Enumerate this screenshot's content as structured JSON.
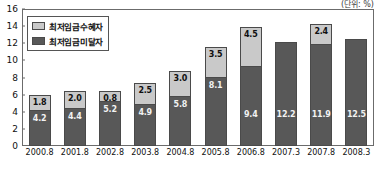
{
  "unit_note": "(단위: %)",
  "legend": {
    "items": [
      {
        "label": "최저임금수혜자",
        "color": "#c9c9c9",
        "key": "beneficiary"
      },
      {
        "label": "최저임금미달자",
        "color": "#585858",
        "key": "below"
      }
    ]
  },
  "chart_data": {
    "type": "bar",
    "subtype": "stacked-bar",
    "title": "",
    "subtitle": "",
    "xlabel": "",
    "ylabel": "",
    "unit": "%",
    "ylim": [
      0,
      16
    ],
    "yticks": [
      0,
      2,
      4,
      6,
      8,
      10,
      12,
      14,
      16
    ],
    "grid": false,
    "legend_position": "top-left",
    "categories": [
      "2000.8",
      "2001.8",
      "2002.8",
      "2003.8",
      "2004.8",
      "2005.8",
      "2006.8",
      "2007.3",
      "2007.8",
      "2008.3"
    ],
    "series": [
      {
        "name": "최저임금미달자",
        "color": "#585858",
        "values": [
          4.2,
          4.4,
          5.2,
          4.9,
          5.8,
          8.1,
          9.4,
          12.2,
          11.9,
          12.5
        ],
        "labels": [
          "4.2",
          "4.4",
          "5.2",
          "4.9",
          "5.8",
          "8.1",
          "9.4",
          "12.2",
          "11.9",
          "12.5"
        ]
      },
      {
        "name": "최저임금수혜자",
        "color": "#c9c9c9",
        "values": [
          1.8,
          2.0,
          0.8,
          2.5,
          3.0,
          3.5,
          4.5,
          0,
          2.4,
          0
        ],
        "labels": [
          "1.8",
          "2.0",
          "0.8",
          "2.5",
          "3.0",
          "3.5",
          "4.5",
          "",
          "2.4",
          ""
        ]
      }
    ],
    "totals": [
      6.0,
      6.4,
      6.0,
      7.4,
      8.8,
      11.6,
      13.9,
      12.2,
      14.3,
      12.5
    ]
  }
}
